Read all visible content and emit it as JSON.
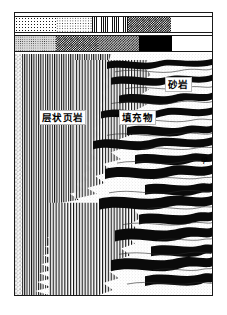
{
  "figure": {
    "name": "geological-outcrop-cross-section",
    "description_kind": "stratigraphic outcrop sketch with hatched legend bars"
  },
  "legend": {
    "bars": [
      {
        "id": "legend-bar-1",
        "cells": [
          {
            "pattern": "speckle",
            "width_pct": 21.0
          },
          {
            "pattern": "fine-dot",
            "width_pct": 18.0
          },
          {
            "pattern": "vert",
            "width_pct": 18.5
          },
          {
            "pattern": "checker",
            "width_pct": 21.5
          },
          {
            "pattern": "blank",
            "width_pct": 21.0
          }
        ]
      },
      {
        "id": "legend-bar-2",
        "cells": [
          {
            "pattern": "grey",
            "width_pct": 21.0
          },
          {
            "pattern": "checker",
            "width_pct": 21.0
          },
          {
            "pattern": "checker-light",
            "width_pct": 21.0
          },
          {
            "pattern": "solid",
            "width_pct": 16.5
          },
          {
            "pattern": "blank",
            "width_pct": 20.5
          }
        ]
      }
    ]
  },
  "annotations": {
    "sandstone": "砂岩",
    "layered_shale": "层状页岩",
    "filling_material": "填充物",
    "porosity_symbol": "φ"
  },
  "colors": {
    "ink": "#1a1a1a",
    "paper": "#ffffff",
    "fill_dark": "#000000",
    "fill_grey": "#d9d9d9"
  }
}
